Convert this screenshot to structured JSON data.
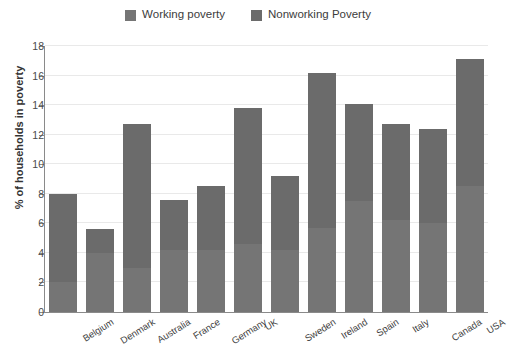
{
  "chart_data": {
    "type": "bar",
    "stacked": true,
    "title": "",
    "xlabel": "",
    "ylabel": "% of households in poverty",
    "ylim": [
      0,
      18
    ],
    "ytick_step": 2,
    "yticks": [
      0,
      2,
      4,
      6,
      8,
      10,
      12,
      14,
      16,
      18
    ],
    "grid": true,
    "legend_position": "top-center",
    "categories": [
      "Belgium",
      "Denmark",
      "Australia",
      "France",
      "Germany",
      "UK",
      "Sweden",
      "Ireland",
      "Spain",
      "Italy",
      "Canada",
      "USA"
    ],
    "series": [
      {
        "name": "Working poverty",
        "color": "#757575",
        "values": [
          2.0,
          4.0,
          3.0,
          4.2,
          4.2,
          4.6,
          4.2,
          5.7,
          7.5,
          6.2,
          6.0,
          8.5
        ]
      },
      {
        "name": "Nonworking Poverty",
        "color": "#6b6b6b",
        "values": [
          6.0,
          1.6,
          9.7,
          3.4,
          4.3,
          9.2,
          5.0,
          10.5,
          6.6,
          6.5,
          6.4,
          8.6
        ]
      }
    ],
    "totals": [
      8.0,
      5.6,
      12.7,
      7.6,
      8.5,
      13.8,
      9.2,
      16.2,
      14.1,
      12.7,
      12.4,
      17.1
    ]
  },
  "legend": {
    "items": [
      {
        "label": "Working poverty",
        "color": "#757575"
      },
      {
        "label": "Nonworking Poverty",
        "color": "#6b6b6b"
      }
    ]
  },
  "axes": {
    "y_title": "% of households in poverty"
  },
  "colors": {
    "gridline": "#e9e9e9",
    "axis": "#8a8a8a",
    "background": "#ffffff",
    "text": "#3b3b3b"
  }
}
